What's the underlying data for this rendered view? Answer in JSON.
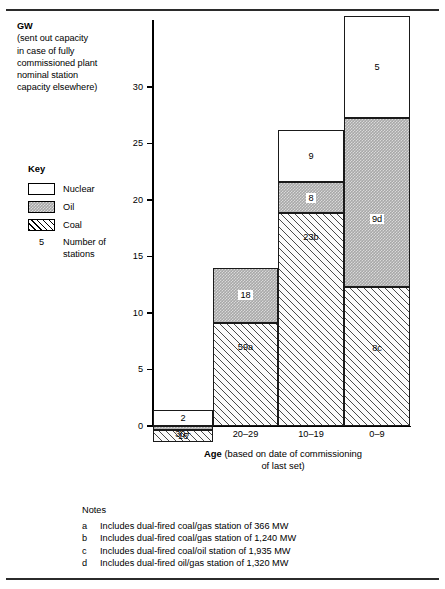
{
  "header": {
    "unit": "GW",
    "note_lines": [
      "(sent out capacity",
      "in case of fully",
      "commissioned plant",
      "nominal station",
      "capacity elsewhere)"
    ]
  },
  "legend": {
    "title": "Key",
    "items": [
      {
        "label": "Nuclear",
        "swatch": "nuclear-swatch",
        "color": "#ffffff"
      },
      {
        "label": "Oil",
        "swatch": "oil-swatch",
        "color": "#a8a8a8"
      },
      {
        "label": "Coal",
        "swatch": "coal-swatch",
        "color": "#ffffff"
      }
    ],
    "count_example": "5",
    "count_label_line1": "Number of",
    "count_label_line2": "stations"
  },
  "axis": {
    "y_ticks": [
      "0",
      "5",
      "10",
      "15",
      "20",
      "25",
      "30"
    ],
    "x_title_bold": "Age",
    "x_title_line1": "(based on date of commissioning",
    "x_title_line2": "of last set)"
  },
  "notes": {
    "title": "Notes",
    "items": [
      {
        "key": "a",
        "text": "Includes dual-fired coal/gas station of 366 MW"
      },
      {
        "key": "b",
        "text": "Includes dual-fired coal/gas station of 1,240 MW"
      },
      {
        "key": "c",
        "text": "Includes dual-fired coal/oil station of 1,935 MW"
      },
      {
        "key": "d",
        "text": "Includes dual-fired oil/gas station of 1,320 MW"
      }
    ]
  },
  "chart_data": {
    "type": "bar",
    "stacked": true,
    "title": "",
    "xlabel": "Age (based on date of commissioning of last set)",
    "ylabel": "GW (sent out capacity in case of fully commissioned plant nominal station capacity elsewhere)",
    "ylim": [
      0,
      36
    ],
    "grid": false,
    "legend_position": "left",
    "categories": [
      "30+",
      "20–29",
      "10–19",
      "0–9"
    ],
    "series": [
      {
        "name": "Coal",
        "values": [
          1.5,
          11.4,
          20.1,
          14.2
        ],
        "color": "#ffffff",
        "pattern": "diagonal-hatch"
      },
      {
        "name": "Oil",
        "values": [
          0.35,
          4.3,
          2.2,
          15.0
        ],
        "color": "#a8a8a8",
        "pattern": "stipple"
      },
      {
        "name": "Nuclear",
        "values": [
          1.4,
          0.0,
          3.9,
          6.8
        ],
        "color": "#ffffff",
        "pattern": "solid"
      }
    ],
    "totals": [
      3.25,
      15.7,
      26.2,
      36.0
    ],
    "data_labels": {
      "Coal": [
        "16",
        "59a",
        "23b",
        "8c"
      ],
      "Oil": [
        "",
        "18",
        "8",
        "9d"
      ],
      "Nuclear": [
        "2",
        "",
        "9",
        "5"
      ]
    }
  },
  "bars": [
    {
      "category": "30+",
      "segments": [
        {
          "type": "coal",
          "label": "16",
          "boxed": false,
          "left": 153,
          "top": 430.0,
          "width": 60,
          "height": 11.5,
          "label_pos": "inside"
        },
        {
          "type": "oil",
          "label": "",
          "boxed": false,
          "left": 153,
          "top": 425.6,
          "width": 60,
          "height": 4.4,
          "label_pos": "none"
        },
        {
          "type": "nuclear",
          "label": "2",
          "boxed": false,
          "left": 153,
          "top": 410.3,
          "width": 60,
          "height": 15.3,
          "label_pos": "inside"
        }
      ]
    },
    {
      "category": "20–29",
      "segments": [
        {
          "type": "coal",
          "label": "59a",
          "boxed": false,
          "left": 213,
          "top": 323.0,
          "width": 65,
          "height": 103.0,
          "label_pos": "inside-upper"
        },
        {
          "type": "oil",
          "label": "18",
          "boxed": true,
          "left": 213,
          "top": 267.5,
          "width": 65,
          "height": 55.5,
          "label_pos": "inside"
        }
      ]
    },
    {
      "category": "10–19",
      "segments": [
        {
          "type": "coal",
          "label": "23b",
          "boxed": false,
          "left": 278,
          "top": 213.0,
          "width": 66,
          "height": 213.0,
          "label_pos": "inside-upper"
        },
        {
          "type": "oil",
          "label": "8",
          "boxed": true,
          "left": 278,
          "top": 182.0,
          "width": 66,
          "height": 31.0,
          "label_pos": "inside"
        },
        {
          "type": "nuclear",
          "label": "9",
          "boxed": false,
          "left": 278,
          "top": 129.5,
          "width": 66,
          "height": 52.5,
          "label_pos": "inside"
        }
      ]
    },
    {
      "category": "0–9",
      "segments": [
        {
          "type": "coal",
          "label": "8c",
          "boxed": false,
          "left": 344,
          "top": 286.5,
          "width": 66,
          "height": 139.5,
          "label_pos": "inside-mid"
        },
        {
          "type": "oil",
          "label": "9d",
          "boxed": true,
          "left": 344,
          "top": 117.5,
          "width": 66,
          "height": 169.0,
          "label_pos": "inside-lower"
        },
        {
          "type": "nuclear",
          "label": "5",
          "boxed": false,
          "left": 344,
          "top": 16.0,
          "width": 66,
          "height": 101.5,
          "label_pos": "inside"
        }
      ]
    }
  ]
}
